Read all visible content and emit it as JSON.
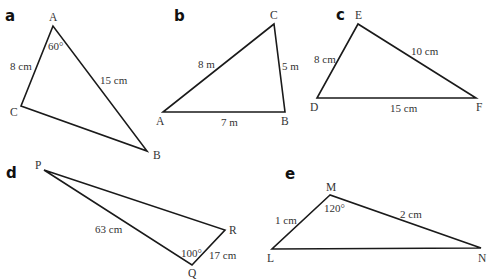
{
  "figures": [
    {
      "id": "a",
      "part_label": "a",
      "vertices": [
        {
          "name": "A",
          "x": 53,
          "y": 26
        },
        {
          "name": "C",
          "x": 21,
          "y": 106
        },
        {
          "name": "B",
          "x": 147,
          "y": 151
        }
      ],
      "side_labels": [
        "8 cm",
        "15 cm"
      ],
      "angle_labels": [
        "60°"
      ]
    },
    {
      "id": "b",
      "part_label": "b",
      "vertices": [
        {
          "name": "C",
          "x": 274,
          "y": 24
        },
        {
          "name": "A",
          "x": 163,
          "y": 112
        },
        {
          "name": "B",
          "x": 285,
          "y": 112
        }
      ],
      "side_labels": [
        "8 m",
        "5 m",
        "7 m"
      ],
      "angle_labels": []
    },
    {
      "id": "c",
      "part_label": "c",
      "vertices": [
        {
          "name": "E",
          "x": 358,
          "y": 24
        },
        {
          "name": "D",
          "x": 317,
          "y": 98
        },
        {
          "name": "F",
          "x": 476,
          "y": 98
        }
      ],
      "side_labels": [
        "8 cm",
        "10 cm",
        "15 cm"
      ],
      "angle_labels": []
    },
    {
      "id": "d",
      "part_label": "d",
      "vertices": [
        {
          "name": "P",
          "x": 44,
          "y": 170
        },
        {
          "name": "R",
          "x": 225,
          "y": 230
        },
        {
          "name": "Q",
          "x": 192,
          "y": 265
        }
      ],
      "side_labels": [
        "63 cm",
        "17 cm"
      ],
      "angle_labels": [
        "100°"
      ]
    },
    {
      "id": "e",
      "part_label": "e",
      "vertices": [
        {
          "name": "M",
          "x": 330,
          "y": 195
        },
        {
          "name": "L",
          "x": 272,
          "y": 249
        },
        {
          "name": "N",
          "x": 481,
          "y": 248
        }
      ],
      "side_labels": [
        "1 cm",
        "2 cm"
      ],
      "angle_labels": [
        "120°"
      ]
    }
  ]
}
